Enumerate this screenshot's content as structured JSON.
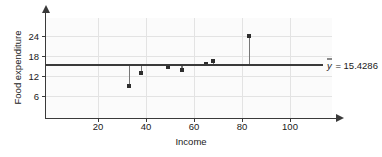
{
  "chart_data": {
    "type": "scatter",
    "title": "",
    "xlabel": "Income",
    "ylabel": "Food expenditure",
    "xlim": [
      0,
      110
    ],
    "ylim": [
      0,
      27
    ],
    "xticks": [
      20,
      40,
      60,
      80,
      100
    ],
    "yticks": [
      6,
      12,
      18,
      24
    ],
    "grid": true,
    "legend": null,
    "x": [
      33,
      38,
      49,
      55,
      65,
      68,
      83
    ],
    "y": [
      9.0,
      13.0,
      14.8,
      13.8,
      15.5,
      16.5,
      24.0
    ],
    "points": [
      {
        "x": 33,
        "y": 9.0
      },
      {
        "x": 38,
        "y": 13.0
      },
      {
        "x": 49,
        "y": 14.8
      },
      {
        "x": 55,
        "y": 13.8
      },
      {
        "x": 65,
        "y": 15.5
      },
      {
        "x": 68,
        "y": 16.5
      },
      {
        "x": 83,
        "y": 24.0
      }
    ],
    "reference_line": {
      "orientation": "horizontal",
      "value": 15.4286,
      "label": "y = 15.4286",
      "label_symbol": "y",
      "label_rest": " = 15.4286"
    },
    "annotations": [
      "y = 15.4286"
    ],
    "marker_style": "stem-and-dot",
    "series": [
      {
        "name": "Food expenditure",
        "values": [
          9.0,
          13.0,
          14.8,
          13.8,
          15.5,
          16.5,
          24.0
        ]
      }
    ]
  },
  "colors": {
    "axis": "#3a3a3a",
    "grid": "#e3e3e3",
    "marker": "#2e2e2e",
    "stem": "#777777",
    "mean_line": "#3a3a3a",
    "plot_background": "#fbfbfb",
    "figure_background": "#ffffff",
    "text": "#1a1a1a"
  }
}
